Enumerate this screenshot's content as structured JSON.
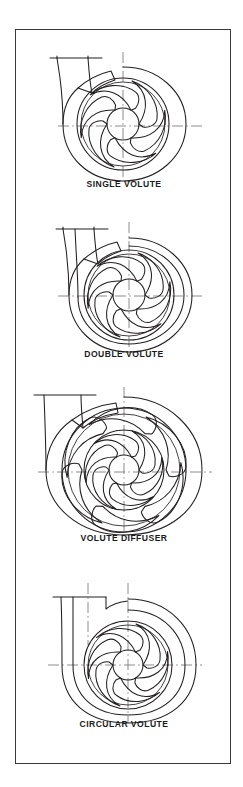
{
  "figure": {
    "background_color": "#ffffff",
    "border_color": "#3a3a3a",
    "line_color": "#231f20",
    "centerline_color": "#6f6f6f",
    "caption_color": "#1a1a1a"
  },
  "panels": [
    {
      "id": "single-volute",
      "caption": "SINGLE VOLUTE",
      "impeller_blades": 6,
      "diffuser_vanes": 0,
      "casing": "expanding spiral volute",
      "discharge": "single tapered nozzle, flared outlet flange",
      "splitter": false
    },
    {
      "id": "double-volute",
      "caption": "DOUBLE VOLUTE",
      "impeller_blades": 6,
      "diffuser_vanes": 0,
      "casing": "expanding spiral volute with internal splitter rib",
      "discharge": "tapered nozzle divided into two channels",
      "splitter": true
    },
    {
      "id": "volute-diffuser",
      "caption": "VOLUTE DIFFUSER",
      "impeller_blades": 6,
      "diffuser_vanes": 6,
      "casing": "spiral volute surrounding a vaned diffuser ring",
      "discharge": "single tapered nozzle",
      "splitter": false
    },
    {
      "id": "circular-volute",
      "caption": "CIRCULAR VOLUTE",
      "impeller_blades": 6,
      "diffuser_vanes": 0,
      "casing": "concentric circular casing of constant width",
      "discharge": "straight rectangular nozzle",
      "splitter": false
    }
  ]
}
